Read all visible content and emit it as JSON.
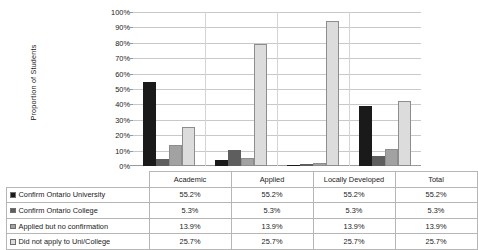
{
  "chart_data": {
    "type": "bar",
    "title": "",
    "xlabel": "",
    "ylabel": "Proportion of Students",
    "ylim": [
      0,
      100
    ],
    "ytick_labels": [
      "100%",
      "90%",
      "80%",
      "70%",
      "60%",
      "50%",
      "40%",
      "30%",
      "20%",
      "10%",
      "0%"
    ],
    "ytick_values": [
      100,
      90,
      80,
      70,
      60,
      50,
      40,
      30,
      20,
      10,
      0
    ],
    "grid": true,
    "legend_position": "data-table-left",
    "categories": [
      "Academic",
      "Applied",
      "Locally Developed",
      "Total"
    ],
    "series": [
      {
        "name": "Confirm Ontario University",
        "color": "#1a1a1a",
        "values": [
          54.6,
          3.6,
          0.8,
          38.8
        ],
        "table_values": [
          "55.2%",
          "55.2%",
          "55.2%",
          "55.2%"
        ]
      },
      {
        "name": "Confirm Ontario College",
        "color": "#5e5e5e",
        "values": [
          4.8,
          10.6,
          1.4,
          6.2
        ],
        "table_values": [
          "5.3%",
          "5.3%",
          "5.3%",
          "5.3%"
        ]
      },
      {
        "name": "Applied but no confirmation",
        "color": "#a2a2a2",
        "values": [
          13.8,
          5.2,
          2.0,
          11.2
        ],
        "table_values": [
          "13.9%",
          "13.9%",
          "13.9%",
          "13.9%"
        ]
      },
      {
        "name": "Did not apply to Uni/College",
        "color": "#dcdcdc",
        "values": [
          25.4,
          79.0,
          94.4,
          42.4
        ],
        "table_values": [
          "25.7%",
          "25.7%",
          "25.7%",
          "25.7%"
        ]
      }
    ]
  },
  "table": {
    "corner_label": "",
    "column_headers": [
      "Academic",
      "Applied",
      "Locally Developed",
      "Total"
    ],
    "rows": [
      {
        "label": "Confirm Ontario University",
        "swatch_color": "#1a1a1a",
        "cells": [
          "55.2%",
          "55.2%",
          "55.2%",
          "55.2%"
        ]
      },
      {
        "label": "Confirm Ontario College",
        "swatch_color": "#5e5e5e",
        "cells": [
          "5.3%",
          "5.3%",
          "5.3%",
          "5.3%"
        ]
      },
      {
        "label": "Applied but no confirmation",
        "swatch_color": "#a2a2a2",
        "cells": [
          "13.9%",
          "13.9%",
          "13.9%",
          "13.9%"
        ]
      },
      {
        "label": "Did not apply to Uni/College",
        "swatch_color": "#dcdcdc",
        "cells": [
          "25.7%",
          "25.7%",
          "25.7%",
          "25.7%"
        ]
      }
    ]
  },
  "colors": {
    "gridline": "#c9c9c9",
    "axis": "#9a9a9a",
    "table_border": "#b6b6b6",
    "background": "#ffffff"
  }
}
